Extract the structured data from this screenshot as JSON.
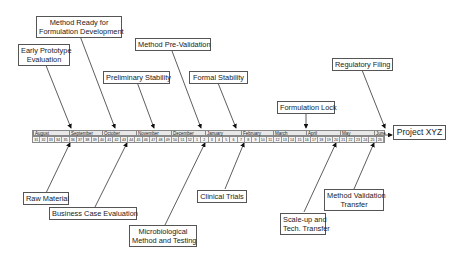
{
  "diagram": {
    "type": "milestone-timeline",
    "project": "Project XYZ",
    "months": [
      {
        "label": "August",
        "x": 0
      },
      {
        "label": "September",
        "x": 36
      },
      {
        "label": "October",
        "x": 69
      },
      {
        "label": "November",
        "x": 103
      },
      {
        "label": "December",
        "x": 138
      },
      {
        "label": "January",
        "x": 172
      },
      {
        "label": "February",
        "x": 208
      },
      {
        "label": "March",
        "x": 240
      },
      {
        "label": "April",
        "x": 273
      },
      {
        "label": "May",
        "x": 307
      },
      {
        "label": "June",
        "x": 341
      }
    ],
    "weeks": [
      "31",
      "32",
      "33",
      "34",
      "35",
      "36",
      "37",
      "38",
      "39",
      "40",
      "41",
      "42",
      "43",
      "44",
      "45",
      "46",
      "47",
      "48",
      "49",
      "50",
      "51",
      "52",
      "1",
      "2",
      "3",
      "4",
      "5",
      "6",
      "7",
      "8",
      "9",
      "10",
      "11",
      "12",
      "13",
      "14",
      "15",
      "16",
      "17",
      "18",
      "19",
      "20",
      "21",
      "22",
      "23",
      "24",
      "25",
      "26"
    ],
    "milestones_above": [
      {
        "label": "Early Prototype\nEvaluation",
        "line1": "Early Prototype",
        "line2": "Evaluation"
      },
      {
        "label": "Method Ready for Formulation Development",
        "line1": "Method Ready for",
        "line2": "Formulation Development"
      },
      {
        "label": "Preliminary Stability",
        "line1": "Preliminary Stability"
      },
      {
        "label": "Method Pre-Validation",
        "line1": "Method Pre-Validation"
      },
      {
        "label": "Formal Stability",
        "line1": "Formal Stability"
      },
      {
        "label": "Formulation Lock",
        "line1": "Formulation Lock"
      },
      {
        "label": "Regulatory Filing",
        "line1": "Regulatory Filing"
      }
    ],
    "milestones_below": [
      {
        "label": "Raw Material",
        "line1": "Raw Material"
      },
      {
        "label": "Business Case Evaluation",
        "line1": "Business Case Evaluation"
      },
      {
        "label": "Microbiological Method and Testing",
        "line1": "Microbiological",
        "line2": "Method and Testing"
      },
      {
        "label": "Clinical Trials",
        "line1": "Clinical Trials"
      },
      {
        "label": "Scale-up and Tech. Transfer",
        "line1": "Scale-up and",
        "line2": "Tech. Transfer"
      },
      {
        "label": "Method Validation Transfer",
        "line1": "Method Validation",
        "line2": "Transfer"
      }
    ]
  }
}
